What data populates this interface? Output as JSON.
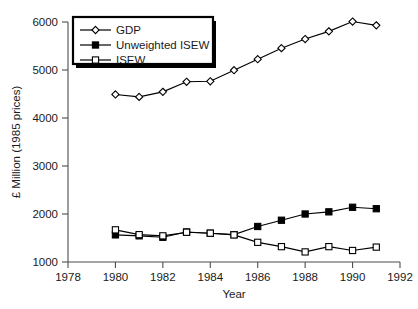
{
  "chart_data": {
    "type": "line",
    "title": "",
    "xlabel": "Year",
    "ylabel": "£ Million (1985 prices)",
    "xlim": [
      1978,
      1992
    ],
    "ylim": [
      1000,
      6000
    ],
    "xticks": [
      1978,
      1980,
      1982,
      1984,
      1986,
      1988,
      1990,
      1992
    ],
    "yticks": [
      1000,
      2000,
      3000,
      4000,
      5000,
      6000
    ],
    "xtick_labels": [
      "1978",
      "1980",
      "1982",
      "1984",
      "1986",
      "1988",
      "1990",
      "1992"
    ],
    "ytick_labels": [
      "1000",
      "2000",
      "3000",
      "4000",
      "5000",
      "6000"
    ],
    "grid": false,
    "legend_position": "upper-left",
    "x": [
      1980,
      1981,
      1982,
      1983,
      1984,
      1985,
      1986,
      1987,
      1988,
      1989,
      1990,
      1991
    ],
    "series": [
      {
        "name": "GDP",
        "marker": "open-diamond",
        "values": [
          4490,
          4440,
          4545,
          4755,
          4765,
          4995,
          5225,
          5455,
          5645,
          5805,
          6010,
          5930
        ]
      },
      {
        "name": "Unweighted ISEW",
        "marker": "filled-square",
        "values": [
          1565,
          1545,
          1515,
          1625,
          1600,
          1570,
          1740,
          1870,
          2000,
          2045,
          2140,
          2110
        ]
      },
      {
        "name": "ISEW",
        "marker": "open-square",
        "values": [
          1670,
          1570,
          1545,
          1620,
          1600,
          1565,
          1410,
          1320,
          1210,
          1320,
          1240,
          1310
        ]
      }
    ]
  },
  "legend": {
    "items": [
      {
        "label": "GDP",
        "marker": "open-diamond"
      },
      {
        "label": "Unweighted ISEW",
        "marker": "filled-square"
      },
      {
        "label": "ISEW",
        "marker": "open-square"
      }
    ]
  },
  "colors": {
    "line": "#000000",
    "axis": "#4d4d4d",
    "text": "#1a1a1a",
    "background": "#ffffff",
    "marker_fill_open": "#ffffff",
    "marker_fill_closed": "#000000"
  }
}
